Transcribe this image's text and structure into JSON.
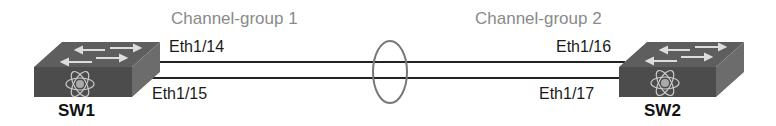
{
  "diagram": {
    "channel_groups": [
      {
        "label": "Channel-group 1"
      },
      {
        "label": "Channel-group 2"
      }
    ],
    "switches": [
      {
        "name": "SW1"
      },
      {
        "name": "SW2"
      }
    ],
    "links": [
      {
        "left_port": "Eth1/14",
        "right_port": "Eth1/16"
      },
      {
        "left_port": "Eth1/15",
        "right_port": "Eth1/17"
      }
    ],
    "colors": {
      "switch_top": "#5a5a5a",
      "switch_front": "#4a4a4a",
      "switch_side": "#6a6a6a",
      "link": "#222222",
      "bundle_ellipse": "#777777",
      "channel_label": "#8a8a8a"
    }
  }
}
